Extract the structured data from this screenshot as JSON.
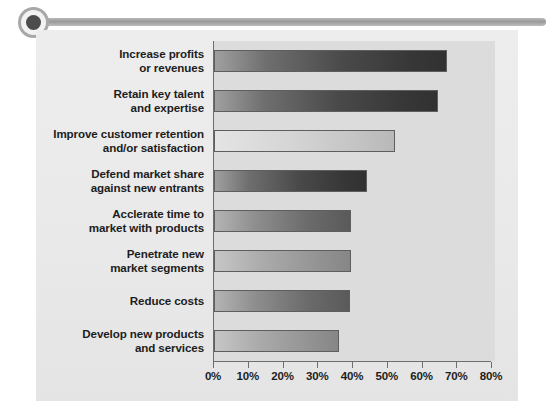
{
  "decoration": {
    "bullet_icon": "circle-bullet-icon",
    "rail_icon": "horizontal-rule-icon",
    "accent_color": "#9a9a9a"
  },
  "chart_data": {
    "type": "bar",
    "orientation": "horizontal",
    "title": "",
    "subtitle": "",
    "xlabel": "",
    "ylabel": "",
    "xlim": [
      0,
      80
    ],
    "grid": false,
    "legend": null,
    "axis_tick_suffix": "%",
    "x_ticks": [
      0,
      10,
      20,
      30,
      40,
      50,
      60,
      70,
      80
    ],
    "x_tick_labels": [
      "0%",
      "10%",
      "20%",
      "30%",
      "40%",
      "50%",
      "60%",
      "70%",
      "80%"
    ],
    "categories": [
      "Increase profits\nor revenues",
      "Retain key talent\nand expertise",
      "Improve customer retention\nand/or satisfaction",
      "Defend market share\nagainst new entrants",
      "Acclerate time to\nmarket with products",
      "Penetrate new\nmarket segments",
      "Reduce costs",
      "Develop new products\nand services"
    ],
    "values": [
      67,
      64.5,
      52,
      44,
      39.5,
      39.5,
      39,
      36
    ],
    "bars": [
      {
        "label_line1": "Increase profits",
        "label_line2": "or revenues",
        "value": 67,
        "shade": "dark"
      },
      {
        "label_line1": "Retain key talent",
        "label_line2": "and expertise",
        "value": 64.5,
        "shade": "dark"
      },
      {
        "label_line1": "Improve customer retention",
        "label_line2": "and/or satisfaction",
        "value": 52,
        "shade": "light"
      },
      {
        "label_line1": "Defend market share",
        "label_line2": "against new entrants",
        "value": 44,
        "shade": "dark"
      },
      {
        "label_line1": "Acclerate time to",
        "label_line2": "market with products",
        "value": 39.5,
        "shade": "mid"
      },
      {
        "label_line1": "Penetrate new",
        "label_line2": "market segments",
        "value": 39.5,
        "shade": "midlight"
      },
      {
        "label_line1": "Reduce costs",
        "label_line2": "",
        "value": 39,
        "shade": "mid"
      },
      {
        "label_line1": "Develop new products",
        "label_line2": "and services",
        "value": 36,
        "shade": "midlight"
      }
    ],
    "colors": {
      "plot_background": "#dcdcdc",
      "card_background": "#ebebeb",
      "axis": "#6e6e6e",
      "text": "#1d1d1d",
      "bar_border": "#5e5e5e"
    }
  }
}
